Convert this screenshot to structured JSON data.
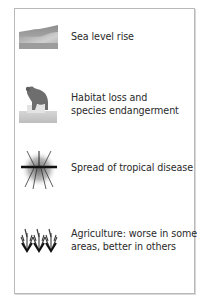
{
  "panel": {
    "items": [
      {
        "icon": "sea-level-icon",
        "lines": [
          "Sea level rise"
        ]
      },
      {
        "icon": "animal-habitat-icon",
        "lines": [
          "Habitat loss and",
          "species endangerment"
        ]
      },
      {
        "icon": "mosquito-icon",
        "lines": [
          "Spread of tropical disease"
        ]
      },
      {
        "icon": "crops-icon",
        "lines": [
          "Agriculture: worse in some",
          "areas, better in others"
        ]
      }
    ]
  },
  "colors": {
    "border": "#b9b9b9",
    "text": "#2a2a2a",
    "icon_dark": "#1a1a1a",
    "icon_mid": "#7a7a7a",
    "icon_light": "#c8c8c8"
  }
}
